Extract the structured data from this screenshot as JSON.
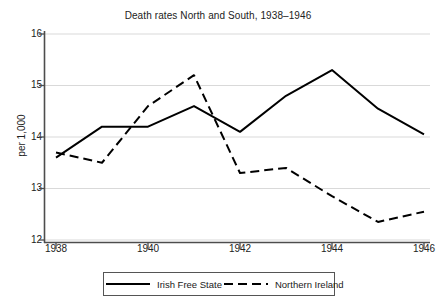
{
  "chart_data": {
    "type": "line",
    "title": "Death rates North and South, 1938–1946",
    "xlabel": "",
    "ylabel": "per 1,000",
    "x": [
      1938,
      1939,
      1940,
      1941,
      1942,
      1943,
      1944,
      1945,
      1946
    ],
    "xticks": [
      "1938",
      "1940",
      "1942",
      "1944",
      "1946"
    ],
    "xtick_values": [
      1938,
      1940,
      1942,
      1944,
      1946
    ],
    "yticks": [
      "12",
      "13",
      "14",
      "15",
      "16"
    ],
    "ytick_values": [
      12,
      13,
      14,
      15,
      16
    ],
    "xlim": [
      1938,
      1946
    ],
    "ylim": [
      12,
      16
    ],
    "grid": "horizontal",
    "legend_position": "bottom",
    "series": [
      {
        "name": "Irish Free State",
        "style": "solid",
        "color": "#000000",
        "values": [
          13.6,
          14.2,
          14.2,
          14.6,
          14.1,
          14.8,
          15.3,
          14.55,
          14.05
        ]
      },
      {
        "name": "Northern Ireland",
        "style": "dashed",
        "color": "#000000",
        "values": [
          13.7,
          13.5,
          14.6,
          15.2,
          13.3,
          13.4,
          12.85,
          12.35,
          12.55
        ]
      }
    ]
  },
  "axis": {
    "y_title": "per 1,000"
  },
  "legend": {
    "items": [
      {
        "label": "Irish Free State",
        "style": "solid"
      },
      {
        "label": "Northern Ireland",
        "style": "dashed"
      }
    ]
  }
}
